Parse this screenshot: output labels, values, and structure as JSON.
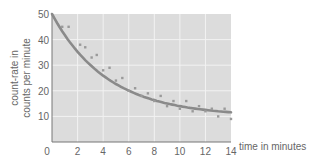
{
  "chart_data": {
    "type": "scatter",
    "title": "",
    "xlabel": "time in minutes",
    "ylabel": "count-rate in counts per minute",
    "ylabel_lines": [
      "count-rate in",
      "counts per minute"
    ],
    "xlim": [
      0,
      14
    ],
    "ylim": [
      0,
      50
    ],
    "x_ticks": [
      0,
      2,
      4,
      6,
      8,
      10,
      12,
      14
    ],
    "y_ticks": [
      10,
      20,
      30,
      40,
      50
    ],
    "grid": true,
    "legend": null,
    "series": [
      {
        "name": "measured count-rate",
        "kind": "scatter",
        "x": [
          0.8,
          1.3,
          2.2,
          2.6,
          3.1,
          3.5,
          4.0,
          4.5,
          5.0,
          5.5,
          6.0,
          6.5,
          7.0,
          7.5,
          8.0,
          8.5,
          9.0,
          9.5,
          10.0,
          10.5,
          11.0,
          11.5,
          12.0,
          12.5,
          13.0,
          13.5,
          14.0
        ],
        "y": [
          45,
          45,
          38,
          37,
          33,
          34,
          28,
          29,
          24,
          25,
          20,
          21,
          18,
          19,
          16,
          18,
          14,
          16,
          13,
          16,
          12,
          14,
          12,
          13,
          10,
          13,
          9
        ]
      },
      {
        "name": "best-fit decay curve",
        "kind": "line",
        "equation": "y = 10 + 40*exp(-0.23*t)",
        "x": [
          0,
          1,
          2,
          3,
          4,
          5,
          6,
          7,
          8,
          9,
          10,
          11,
          12,
          13,
          14
        ],
        "y": [
          50,
          41.8,
          35.3,
          30.1,
          26.0,
          22.7,
          20.1,
          18.0,
          16.4,
          15.1,
          14.0,
          13.2,
          12.5,
          12.0,
          11.6
        ]
      }
    ]
  },
  "colors": {
    "plot_background": "#dcdcdc",
    "grid": "#f2f2f2",
    "axis": "#777777",
    "curve": "#8a8a8a",
    "points": "#9a9a9a",
    "text": "#666666"
  }
}
